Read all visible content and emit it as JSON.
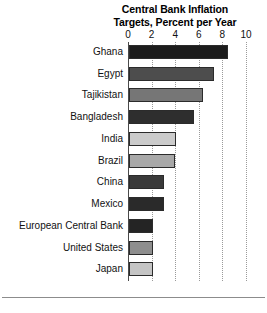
{
  "chart": {
    "title_line1": "Central Bank Inflation",
    "title_line2": "Targets, Percent per Year"
  },
  "chart_data": {
    "type": "bar",
    "orientation": "horizontal",
    "title": "Central Bank Inflation Targets, Percent per Year",
    "xlabel": "",
    "ylabel": "",
    "xlim": [
      0,
      10
    ],
    "xticks": [
      0,
      2,
      4,
      6,
      8,
      10
    ],
    "xtick_labels": [
      "0",
      "2",
      "4",
      "6",
      "8",
      "10"
    ],
    "grid": "vertical-dotted",
    "legend": "none",
    "categories": [
      "Ghana",
      "Egypt",
      "Tajikistan",
      "Bangladesh",
      "India",
      "Brazil",
      "China",
      "Mexico",
      "European Central Bank",
      "United States",
      "Japan"
    ],
    "values": [
      8.4,
      7.2,
      6.3,
      5.5,
      4.0,
      3.9,
      3.0,
      3.0,
      2.0,
      2.0,
      2.0
    ],
    "bar_colors": [
      "#1c1c1c",
      "#4d4d4d",
      "#767676",
      "#2e2e2e",
      "#cbcbcb",
      "#a8a8a8",
      "#3a3a3a",
      "#2a2a2a",
      "#242424",
      "#8e8e8e",
      "#c4c4c4"
    ]
  }
}
